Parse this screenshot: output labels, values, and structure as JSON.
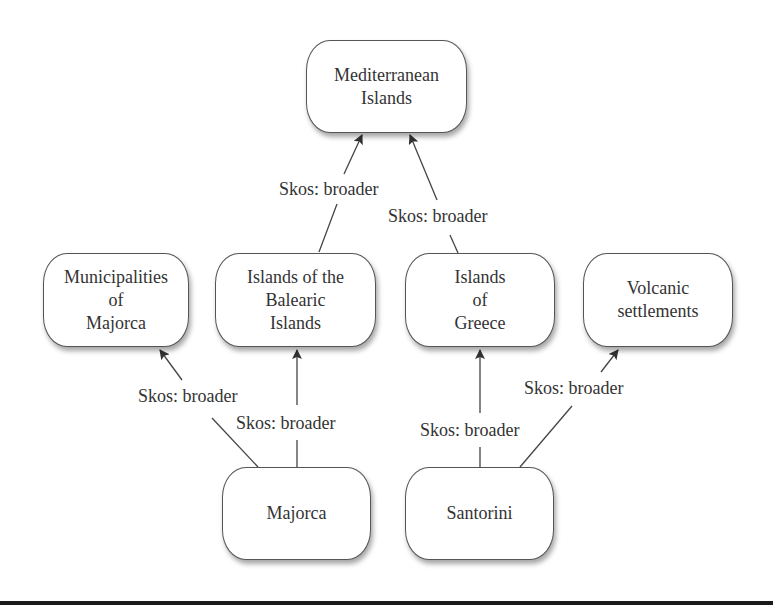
{
  "diagram": {
    "type": "skos-concept-hierarchy",
    "nodes": {
      "mediterranean": {
        "label": "Mediterranean\nIslands"
      },
      "municipalities": {
        "label": "Municipalities\nof\nMajorca"
      },
      "balearic": {
        "label": "Islands of the\nBalearic\nIslands"
      },
      "greece": {
        "label": "Islands\nof\nGreece"
      },
      "volcanic": {
        "label": "Volcanic\nsettlements"
      },
      "majorca": {
        "label": "Majorca"
      },
      "santorini": {
        "label": "Santorini"
      }
    },
    "edges": [
      {
        "from": "balearic",
        "to": "mediterranean",
        "label": "Skos: broader"
      },
      {
        "from": "greece",
        "to": "mediterranean",
        "label": "Skos: broader"
      },
      {
        "from": "majorca",
        "to": "municipalities",
        "label": "Skos: broader"
      },
      {
        "from": "majorca",
        "to": "balearic",
        "label": "Skos: broader"
      },
      {
        "from": "santorini",
        "to": "greece",
        "label": "Skos: broader"
      },
      {
        "from": "santorini",
        "to": "volcanic",
        "label": "Skos: broader"
      }
    ],
    "colors": {
      "node_border": "#555555",
      "line": "#444444",
      "text": "#333333",
      "background": "#ffffff",
      "rule": "#1a1a1a"
    }
  }
}
